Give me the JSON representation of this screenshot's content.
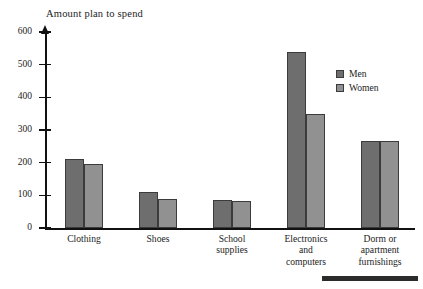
{
  "figure": {
    "axis_title": "Amount plan to spend",
    "bottom_rule_present": true
  },
  "legend": {
    "position": "top-right",
    "entries": [
      {
        "label": "Men",
        "color": "#6e6e6e"
      },
      {
        "label": "Women",
        "color": "#919191"
      }
    ]
  },
  "chart_data": {
    "type": "bar",
    "title": "Amount plan to spend",
    "xlabel": "",
    "ylabel": "Amount plan to spend",
    "ylim": [
      0,
      600
    ],
    "yticks": [
      0,
      100,
      200,
      300,
      400,
      500,
      600
    ],
    "ytick_labels": [
      "0",
      "100",
      "200",
      "300",
      "400",
      "500",
      "600"
    ],
    "grid": false,
    "legend_position": "top-right",
    "categories": [
      "Clothing",
      "Shoes",
      "School supplies",
      "Electronics and computers",
      "Dorm or apartment furnishings"
    ],
    "category_label_lines": [
      [
        "Clothing"
      ],
      [
        "Shoes"
      ],
      [
        "School",
        "supplies"
      ],
      [
        "Electronics",
        "and",
        "computers"
      ],
      [
        "Dorm or",
        "apartment",
        "furnishings"
      ]
    ],
    "series": [
      {
        "name": "Men",
        "color": "#6e6e6e",
        "values": [
          210,
          110,
          87,
          540,
          267
        ]
      },
      {
        "name": "Women",
        "color": "#919191",
        "values": [
          197,
          90,
          83,
          350,
          267
        ]
      }
    ]
  }
}
